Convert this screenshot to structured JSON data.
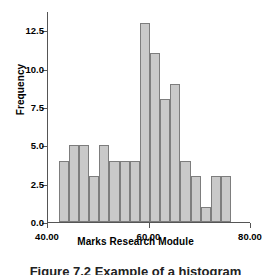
{
  "figure": {
    "caption": "Figure 7.2  Example of a histogram"
  },
  "chart_data": {
    "type": "bar",
    "subtype": "histogram",
    "title": "",
    "xlabel": "Marks Research Module",
    "ylabel": "Frequency",
    "xlim": [
      40.0,
      80.0
    ],
    "ylim": [
      0.0,
      13.75
    ],
    "grid": false,
    "legend": null,
    "bin_width": 2.0,
    "bar_color": "#c9c9c9",
    "bar_edge_color": "#7d7d7d",
    "x_ticks": [
      40.0,
      60.0,
      80.0
    ],
    "x_tick_labels": [
      "40.00",
      "60.00",
      "80.00"
    ],
    "y_ticks": [
      0.0,
      2.5,
      5.0,
      7.5,
      10.0,
      12.5
    ],
    "y_tick_labels": [
      "0.0",
      "2.5",
      "5.0",
      "7.5",
      "10.0",
      "12.5"
    ],
    "bins": [
      {
        "start": 42.3,
        "end": 44.3,
        "center": 43.3,
        "value": 4
      },
      {
        "start": 44.3,
        "end": 46.3,
        "center": 45.3,
        "value": 5
      },
      {
        "start": 46.3,
        "end": 48.3,
        "center": 47.3,
        "value": 5
      },
      {
        "start": 48.3,
        "end": 50.3,
        "center": 49.3,
        "value": 3
      },
      {
        "start": 50.3,
        "end": 52.3,
        "center": 51.3,
        "value": 5
      },
      {
        "start": 52.3,
        "end": 54.3,
        "center": 53.3,
        "value": 4
      },
      {
        "start": 54.3,
        "end": 56.3,
        "center": 55.3,
        "value": 4
      },
      {
        "start": 56.3,
        "end": 58.3,
        "center": 57.3,
        "value": 4
      },
      {
        "start": 58.3,
        "end": 60.3,
        "center": 59.3,
        "value": 13
      },
      {
        "start": 60.3,
        "end": 62.3,
        "center": 61.3,
        "value": 11
      },
      {
        "start": 62.3,
        "end": 64.3,
        "center": 63.3,
        "value": 8
      },
      {
        "start": 64.3,
        "end": 66.3,
        "center": 65.3,
        "value": 9
      },
      {
        "start": 66.3,
        "end": 68.3,
        "center": 67.3,
        "value": 4
      },
      {
        "start": 68.3,
        "end": 70.3,
        "center": 69.3,
        "value": 3
      },
      {
        "start": 70.3,
        "end": 72.3,
        "center": 71.3,
        "value": 1
      },
      {
        "start": 72.3,
        "end": 74.3,
        "center": 73.3,
        "value": 3
      },
      {
        "start": 74.3,
        "end": 76.3,
        "center": 75.3,
        "value": 3
      }
    ],
    "categories": [
      "43.3",
      "45.3",
      "47.3",
      "49.3",
      "51.3",
      "53.3",
      "55.3",
      "57.3",
      "59.3",
      "61.3",
      "63.3",
      "65.3",
      "67.3",
      "69.3",
      "71.3",
      "73.3",
      "75.3"
    ],
    "values": [
      4,
      5,
      5,
      3,
      5,
      4,
      4,
      4,
      13,
      11,
      8,
      9,
      4,
      3,
      1,
      3,
      3
    ]
  }
}
